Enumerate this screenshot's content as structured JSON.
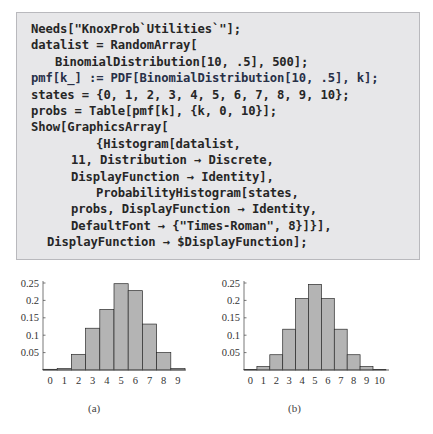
{
  "code": {
    "lines": [
      {
        "text": "Needs[\"KnoxProb`Utilities`\"];",
        "indent": 31
      },
      {
        "text": "datalist = RandomArray[",
        "indent": 31
      },
      {
        "text": "BinomialDistribution[10, .5], 500];",
        "indent": 55
      },
      {
        "text": "pmf[k_] := PDF[BinomialDistribution[10, .5], k];",
        "indent": 31
      },
      {
        "text": "states = {0, 1, 2, 3, 4, 5, 6, 7, 8, 9, 10};",
        "indent": 31
      },
      {
        "text": "probs = Table[pmf[k], {k, 0, 10}];",
        "indent": 31
      },
      {
        "text": "Show[GraphicsArray[",
        "indent": 31
      },
      {
        "text": "{Histogram[datalist,",
        "indent": 96
      },
      {
        "text": "11, Distribution → Discrete,",
        "indent": 71
      },
      {
        "text": "DisplayFunction → Identity],",
        "indent": 71
      },
      {
        "text": "ProbabilityHistogram[states,",
        "indent": 96
      },
      {
        "text": "probs, DisplayFunction → Identity,",
        "indent": 71
      },
      {
        "text": "DefaultFont → {\"Times-Roman\", 8}]}],",
        "indent": 71
      },
      {
        "text": "DisplayFunction → $DisplayFunction];",
        "indent": 47
      }
    ]
  },
  "colors": {
    "code_bg": "#e7e7e9",
    "code_border": "#b9b9bd",
    "bar_fill": "#b4b4b4",
    "bar_stroke": "#2a2a2a",
    "axis": "#555555"
  },
  "chart_data": [
    {
      "type": "bar",
      "title": "",
      "caption": "(a)",
      "xlabel": "",
      "ylabel": "",
      "categories": [
        "0",
        "1",
        "2",
        "3",
        "4",
        "5",
        "6",
        "7",
        "8",
        "9"
      ],
      "values": [
        0.002,
        0.004,
        0.045,
        0.12,
        0.174,
        0.248,
        0.228,
        0.132,
        0.05,
        0.004
      ],
      "yticks": [
        "0.05",
        "0.1",
        "0.15",
        "0.2",
        "0.25"
      ],
      "ylim": [
        0,
        0.25
      ],
      "grid": false,
      "legend": null
    },
    {
      "type": "bar",
      "title": "",
      "caption": "(b)",
      "xlabel": "",
      "ylabel": "",
      "categories": [
        "0",
        "1",
        "2",
        "3",
        "4",
        "5",
        "6",
        "7",
        "8",
        "9",
        "10"
      ],
      "values": [
        0.001,
        0.0098,
        0.0439,
        0.1172,
        0.2051,
        0.2461,
        0.2051,
        0.1172,
        0.0439,
        0.0098,
        0.001
      ],
      "yticks": [
        "0.05",
        "0.1",
        "0.15",
        "0.2",
        "0.25"
      ],
      "ylim": [
        0,
        0.25
      ],
      "grid": false,
      "legend": null
    }
  ]
}
